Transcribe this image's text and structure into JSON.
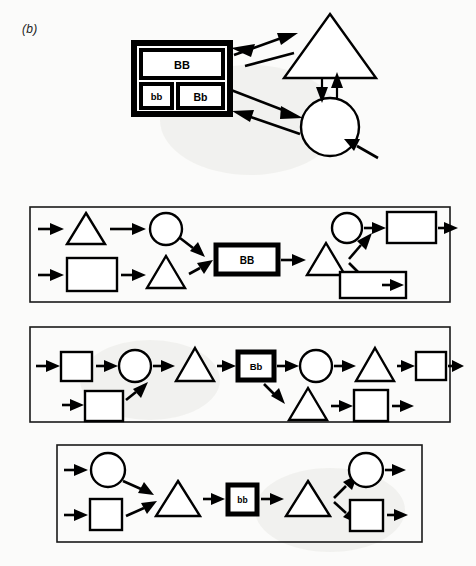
{
  "figure": {
    "label": "(b)",
    "background_color": "#fbfbfa",
    "ink_color": "#000000",
    "width": 476,
    "height": 566
  },
  "diagram_data": {
    "type": "diagram",
    "description": "Genetics flow diagram: a Punnett-square-like genotype box linked by double arrows to a triangle and a circle, above three bordered panels each showing a chain of shapes passing through a genotype box.",
    "top_section": {
      "name": "genotype-interaction-diagram",
      "genotype_box": {
        "name": "punnett-box",
        "cells": [
          {
            "label": "BB",
            "row": 0,
            "span": "full"
          },
          {
            "label": "bb",
            "row": 1,
            "span": "half-left"
          },
          {
            "label": "Bb",
            "row": 1,
            "span": "half-right"
          }
        ]
      },
      "nodes": [
        {
          "name": "triangle-node",
          "shape": "triangle"
        },
        {
          "name": "circle-node",
          "shape": "circle"
        }
      ],
      "connections": [
        {
          "from": "punnett-box-BB",
          "to": "triangle-node",
          "style": "double-headed"
        },
        {
          "from": "punnett-box-Bb",
          "to": "circle-node",
          "style": "double-headed"
        },
        {
          "from": "triangle-node",
          "to": "circle-node",
          "style": "bidirectional-vertical-pair"
        },
        {
          "from": "external",
          "to": "circle-node",
          "style": "single-incoming"
        }
      ]
    },
    "panels": [
      {
        "name": "panel-BB",
        "genotype": "BB",
        "genotype_box_shape": "rectangle-wide",
        "inputs": [
          {
            "row": "top",
            "sequence": [
              "triangle",
              "circle"
            ]
          },
          {
            "row": "bottom",
            "sequence": [
              "square",
              "triangle"
            ]
          }
        ],
        "outputs": [
          {
            "row": "top",
            "sequence": [
              "circle",
              "square"
            ],
            "terminal_arrow": true
          },
          {
            "row": "bottom",
            "sequence": [
              "square"
            ],
            "terminal_arrow": true
          }
        ],
        "after_box": [
          "triangle"
        ]
      },
      {
        "name": "panel-Bb",
        "genotype": "Bb",
        "genotype_box_shape": "rectangle-small",
        "inputs": [
          {
            "row": "top",
            "sequence": [
              "square",
              "circle",
              "triangle"
            ]
          },
          {
            "row": "bottom",
            "sequence": [
              "square"
            ]
          }
        ],
        "outputs": [
          {
            "row": "top",
            "sequence": [
              "circle",
              "triangle",
              "square"
            ],
            "terminal_arrow": true
          },
          {
            "row": "bottom",
            "sequence": [
              "triangle",
              "square"
            ],
            "terminal_arrow": true
          }
        ],
        "after_box": []
      },
      {
        "name": "panel-bb",
        "genotype": "bb",
        "genotype_box_shape": "square-small",
        "inputs": [
          {
            "row": "top",
            "sequence": [
              "circle"
            ]
          },
          {
            "row": "bottom",
            "sequence": [
              "square"
            ]
          },
          {
            "row": "merge",
            "sequence": [
              "triangle"
            ]
          }
        ],
        "outputs": [
          {
            "row": "top",
            "sequence": [
              "circle"
            ],
            "terminal_arrow": true
          },
          {
            "row": "bottom",
            "sequence": [
              "square"
            ],
            "terminal_arrow": true
          }
        ],
        "after_box": [
          "triangle"
        ]
      }
    ]
  }
}
